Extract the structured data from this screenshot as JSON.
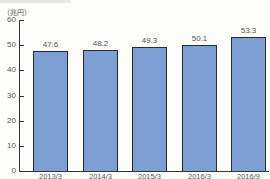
{
  "chart_data": {
    "type": "bar",
    "title": "",
    "unit_label": "（兆円）",
    "xlabel": "",
    "ylabel": "（兆円）",
    "ylim": [
      0,
      60
    ],
    "yticks": [
      "0",
      "10",
      "20",
      "30",
      "40",
      "50",
      "60"
    ],
    "categories": [
      "2013/3",
      "2014/3",
      "2015/3",
      "2016/3",
      "2016/9"
    ],
    "values": [
      47.6,
      48.2,
      49.3,
      50.1,
      53.3
    ],
    "value_labels": [
      "47.6",
      "48.2",
      "49.3",
      "50.1",
      "53.3"
    ],
    "bar_color": "#7d9fd4",
    "grid": false,
    "legend": null
  }
}
